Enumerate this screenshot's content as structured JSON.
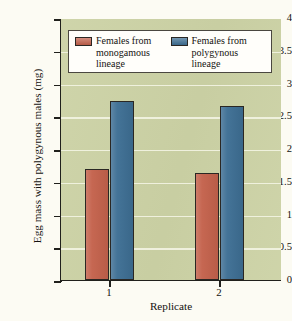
{
  "chart_data": {
    "type": "bar",
    "title": "",
    "xlabel": "Replicate",
    "ylabel": "Egg mass with polygynous males (mg)",
    "categories": [
      "1",
      "2"
    ],
    "series": [
      {
        "name": "Females from monogamous lineage",
        "values": [
          1.69,
          1.63
        ],
        "color": "#c4624c"
      },
      {
        "name": "Females from polygynous lineage",
        "values": [
          2.73,
          2.66
        ],
        "color": "#3e6f94"
      }
    ],
    "ylim": [
      0,
      4
    ],
    "yticks": [
      "0",
      "0.5",
      "1",
      "1.5",
      "2",
      "2.5",
      "3",
      "3.5",
      "4"
    ],
    "ytick_values": [
      0,
      0.5,
      1,
      1.5,
      2,
      2.5,
      3,
      3.5,
      4
    ],
    "grid": true,
    "grid_axis": "y",
    "legend_position": "upper-center",
    "plot_background": "#ccd2a5",
    "gridline_color": "#f2f3e2"
  },
  "legend": {
    "entries": [
      {
        "label_line1": "Females from",
        "label_line2": "monogamous",
        "label_line3": "lineage"
      },
      {
        "label_line1": "Females from",
        "label_line2": "polygynous",
        "label_line3": "lineage"
      }
    ]
  },
  "axes": {
    "y_title": "Egg mass with polygynous males (mg)",
    "x_title": "Replicate"
  }
}
